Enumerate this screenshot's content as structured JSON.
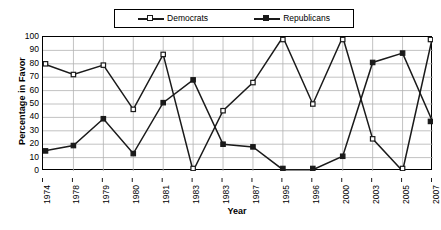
{
  "chart_data": {
    "type": "line",
    "title": "",
    "xlabel": "Year",
    "ylabel": "Percentage in Favor",
    "ylim": [
      0,
      100
    ],
    "ytick_step": 10,
    "yticks": [
      100,
      90,
      80,
      70,
      60,
      50,
      40,
      30,
      20,
      10,
      0
    ],
    "grid": true,
    "grid_color": "#b3b3b3",
    "legend_position": "top-center",
    "categories": [
      "1974",
      "1978",
      "1979",
      "1980",
      "1981",
      "1983",
      "1983",
      "1987",
      "1995",
      "1996",
      "2000",
      "2003",
      "2005",
      "2007"
    ],
    "series": [
      {
        "name": "Democrats",
        "marker": "open-square",
        "color": "#1a1a1a",
        "values": [
          80,
          72,
          79,
          46,
          87,
          0,
          45,
          66,
          100,
          50,
          100,
          24,
          0,
          100
        ]
      },
      {
        "name": "Republicans",
        "marker": "filled-square",
        "color": "#1a1a1a",
        "values": [
          15,
          19,
          39,
          13,
          51,
          68,
          20,
          18,
          1,
          1,
          11,
          81,
          88,
          37
        ]
      }
    ]
  },
  "legend": {
    "entries": [
      {
        "label": "Democrats",
        "marker": "open-square"
      },
      {
        "label": "Republicans",
        "marker": "filled-square"
      }
    ]
  },
  "axes": {
    "y_title": "Percentage in Favor",
    "x_title": "Year"
  }
}
